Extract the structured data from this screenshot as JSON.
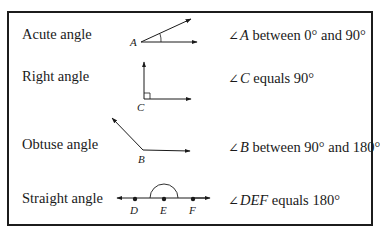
{
  "rows": [
    {
      "label": "Acute angle",
      "vertex": "A",
      "symbol": "∠",
      "var": "A",
      "desc": " between 0° and 90°"
    },
    {
      "label": "Right angle",
      "vertex": "C",
      "symbol": "∠",
      "var": "C",
      "desc": " equals 90°"
    },
    {
      "label": "Obtuse angle",
      "vertex": "B",
      "symbol": "∠",
      "var": "B",
      "desc": " between 90° and 180°"
    },
    {
      "label": "Straight angle",
      "points": [
        "D",
        "E",
        "F"
      ],
      "symbol": "∠",
      "var": "DEF",
      "desc": " equals 180°"
    }
  ],
  "colors": {
    "ink": "#1a1a1a",
    "border": "#1c1c1c",
    "background": "#ffffff"
  }
}
